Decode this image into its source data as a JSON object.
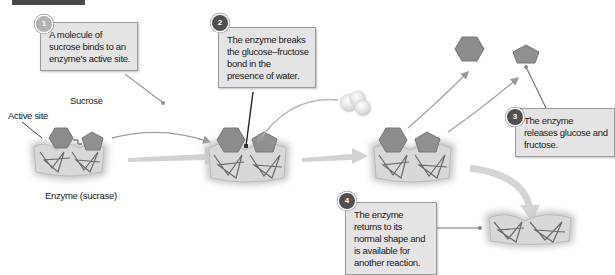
{
  "figure": {
    "steps": [
      {
        "number": "1",
        "text": "A molecule of sucrose binds to an enzyme's active site."
      },
      {
        "number": "2",
        "text": "The enzyme breaks the glucose–fructose bond in the presence of water."
      },
      {
        "number": "3",
        "text": "The enzyme releases glucose and fructose."
      },
      {
        "number": "4",
        "text": "The enzyme returns to its normal shape and is available for another reaction."
      }
    ],
    "labels": {
      "sucrose": "Sucrose",
      "active_site": "Active site",
      "enzyme": "Enzyme (sucrase)"
    },
    "colors": {
      "callout_bg": "#e4e4e4",
      "shape_fill": "#8c8c8c",
      "enzyme_fill": "#d8d8d8",
      "arrow": "#c8c8c8"
    }
  }
}
